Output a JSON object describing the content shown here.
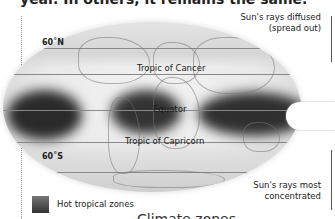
{
  "header": {
    "text": "year. In others, it remains the same."
  },
  "map": {
    "latitudes": {
      "north": "60˚N",
      "south": "60˚S"
    },
    "lines": {
      "tropic_cancer": "Tropic of Cancer",
      "equator": "Equator",
      "tropic_capricorn": "Tropic of Capricorn"
    }
  },
  "annotations": {
    "diffused_line1": "Sun's rays diffused",
    "diffused_line2": "(spread out)",
    "concentrated_line1": "Sun's rays most",
    "concentrated_line2": "concentrated"
  },
  "legend": {
    "label": "Hot tropical zones",
    "color": "#444444"
  },
  "caption": "Climate zones"
}
